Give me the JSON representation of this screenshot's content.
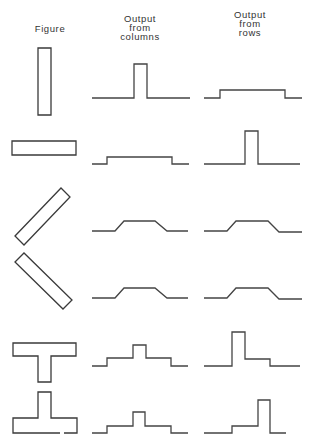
{
  "headers": {
    "figure": "Figure",
    "columns": [
      "Output",
      "from",
      "columns"
    ],
    "rows": [
      "Output",
      "from",
      "rows"
    ]
  },
  "rows": [
    {
      "figure": "vertical-bar",
      "figure_points": "38,48 51,48 51,115 38,115",
      "col_output": "92,98 134,98 134,64 147,64 147,98 190,98",
      "row_output": "204,98 220,98 220,90 285,90 285,98 302,98"
    },
    {
      "figure": "horizontal-bar",
      "figure_points": "12,141 76,141 76,155 12,155",
      "col_output": "92,164 107,164 107,157 172,157 172,164 189,164",
      "row_output": "204,164 245,164 245,131 258,131 258,164 300,164"
    },
    {
      "figure": "diagonal-bar-rising",
      "figure_points": "15,236 61,188 70,197 24,245",
      "col_output": "92,231 115,231 124,221 155,221 167,231 188,231",
      "row_output": "204,231 227,231 236,221 268,221 279,232 302,232"
    },
    {
      "figure": "diagonal-bar-falling",
      "figure_points": "15,262 24,253 72,300 63,309",
      "col_output": "92,298 115,298 124,288 155,288 167,298 188,298",
      "row_output": "204,298 227,298 236,288 268,288 279,299 302,299"
    },
    {
      "figure": "t-shape",
      "figure_points": "13,343 76,343 76,356 51,356 51,382 38,382 38,356 13,356",
      "col_output": "92,366 107,366 107,358 133,358 133,345 146,345 146,358 171,358 171,366 188,366",
      "row_output": "204,366 232,366 232,332 245,332 245,359 270,359 270,366 300,366"
    },
    {
      "figure": "inverted-t-shape",
      "figure_points": "38,392 51,392 51,418 77,418 77,433 13,433 13,418 38,418",
      "col_output": "92,433 107,433 107,426 133,426 133,412 145,412 145,426 171,426 171,433 188,433",
      "row_output": "204,433 232,433 232,426 258,426 258,400 270,400 270,433 286,433"
    }
  ],
  "colors": {
    "stroke": "#3a3a3a",
    "background": "#ffffff"
  }
}
